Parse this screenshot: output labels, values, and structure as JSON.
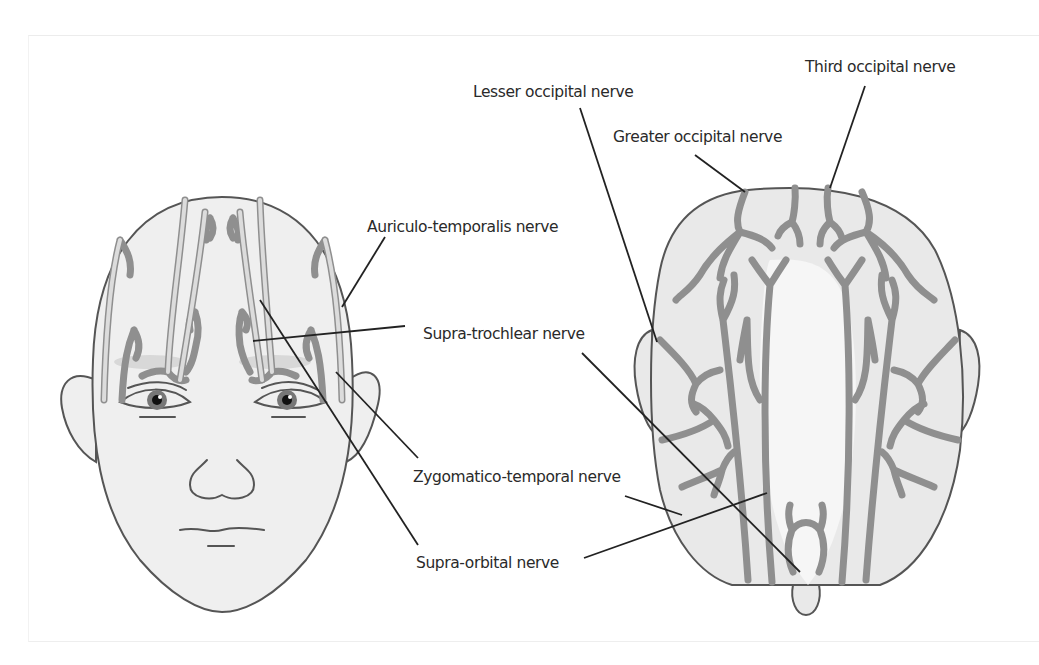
{
  "figure": {
    "views": {
      "front": "Frontal view of head",
      "top": "Vertex (top) view of head"
    },
    "labels": {
      "third_occipital": "Third occipital nerve",
      "lesser_occipital": "Lesser occipital nerve",
      "greater_occipital": "Greater occipital nerve",
      "auriculo_temporalis": "Auriculo-temporalis nerve",
      "supra_trochlear": "Supra-trochlear nerve",
      "zygomatico_temporal": "Zygomatico-temporal nerve",
      "supra_orbital": "Supra-orbital nerve"
    },
    "colors": {
      "skin": "#efefef",
      "outline": "#555555",
      "nerve": "#8f8f8f",
      "leader": "#222222",
      "text": "#2a2a2a"
    }
  }
}
